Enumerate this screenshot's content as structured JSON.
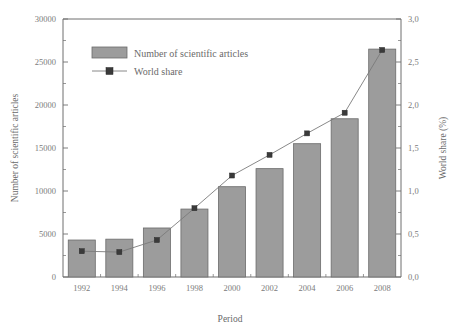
{
  "chart_data": {
    "type": "bar",
    "title": "",
    "subtitle": "",
    "xlabel": "Period",
    "ylabel": "Number of scientific articles",
    "y2label": "World share (%)",
    "categories": [
      "1992",
      "1994",
      "1996",
      "1998",
      "2000",
      "2002",
      "2004",
      "2006",
      "2008"
    ],
    "ylim": [
      0,
      30000
    ],
    "y2lim": [
      0.0,
      3.0
    ],
    "y_ticks": [
      "0",
      "5000",
      "10000",
      "15000",
      "20000",
      "25000",
      "30000"
    ],
    "y_tick_values": [
      0,
      5000,
      10000,
      15000,
      20000,
      25000,
      30000
    ],
    "y2_ticks": [
      "0,0",
      "0,5",
      "1,0",
      "1,5",
      "2,0",
      "2,5",
      "3,0"
    ],
    "y2_tick_values": [
      0.0,
      0.5,
      1.0,
      1.5,
      2.0,
      2.5,
      3.0
    ],
    "grid": false,
    "legend_position": "top-left-inside",
    "series": [
      {
        "name": "Number of scientific articles",
        "kind": "bar",
        "axis": "left",
        "color": "#9c9c9c",
        "edge_color": "#6b6b6b",
        "values": [
          4300,
          4400,
          5700,
          7900,
          10500,
          12600,
          15500,
          18400,
          26500
        ]
      },
      {
        "name": "World share",
        "kind": "line",
        "axis": "right",
        "color": "#7a7a7a",
        "marker_color": "#3a3a3a",
        "marker": "square",
        "values": [
          0.3,
          0.29,
          0.43,
          0.8,
          1.18,
          1.42,
          1.67,
          1.91,
          2.64
        ]
      }
    ]
  },
  "legend": {
    "items": [
      {
        "label": "Number of scientific articles",
        "type": "bar-swatch"
      },
      {
        "label": "World share",
        "type": "line-marker"
      }
    ]
  },
  "axes": {
    "x_title": "Period",
    "y_left_title": "Number of scientific articles",
    "y_right_title": "World share (%)"
  }
}
